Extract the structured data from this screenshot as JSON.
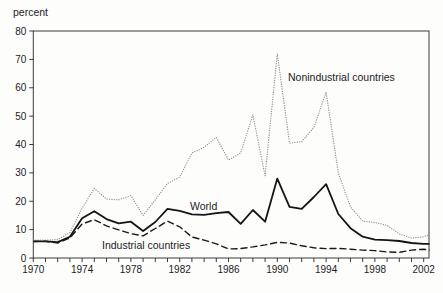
{
  "figure": {
    "y_axis_title": "percent",
    "annotations": [
      {
        "id": "nonindustrial",
        "text": "Nonindustrial countries",
        "x": 288,
        "y": 81
      },
      {
        "id": "world",
        "text": "World",
        "x": 190,
        "y": 210
      },
      {
        "id": "industrial",
        "text": "Industrial countries",
        "x": 102,
        "y": 249
      }
    ]
  },
  "chart_data": {
    "type": "line",
    "title": "",
    "xlabel": "",
    "ylabel": "percent",
    "ylim": [
      0,
      80
    ],
    "yticks": [
      0,
      10,
      20,
      30,
      40,
      50,
      60,
      70,
      80
    ],
    "xticks_labeled": [
      1970,
      1974,
      1978,
      1982,
      1986,
      1990,
      1994,
      1998,
      2002
    ],
    "xticks_minor_every_year": true,
    "grid": false,
    "legend_position": "inline-labels",
    "x": [
      1970,
      1971,
      1972,
      1973,
      1974,
      1975,
      1976,
      1977,
      1978,
      1979,
      1980,
      1981,
      1982,
      1983,
      1984,
      1985,
      1986,
      1987,
      1988,
      1989,
      1990,
      1991,
      1992,
      1993,
      1994,
      1995,
      1996,
      1997,
      1998,
      1999,
      2000,
      2001,
      2002,
      2003
    ],
    "series": [
      {
        "name": "Nonindustrial countries",
        "style": "dotted",
        "color": "#8f8f8f",
        "values": [
          6.3,
          6.3,
          6.5,
          9,
          17.5,
          24.5,
          20.8,
          20.5,
          22,
          15,
          20.5,
          26.3,
          28.5,
          37,
          39,
          42.5,
          34.5,
          37,
          50.5,
          29,
          72,
          40.5,
          41,
          46,
          58.5,
          30,
          18,
          13,
          12.5,
          11.5,
          8.5,
          7,
          7.5,
          9
        ]
      },
      {
        "name": "World",
        "style": "solid",
        "color": "#151515",
        "values": [
          5.9,
          5.9,
          5.6,
          7.5,
          14,
          16.5,
          13.7,
          12.2,
          12.8,
          9.5,
          12.7,
          17.3,
          16.6,
          15.4,
          15.2,
          15.8,
          16.2,
          12,
          16.9,
          12.8,
          28,
          18,
          17.3,
          21.5,
          26,
          15.5,
          10.5,
          7.5,
          6.5,
          6.3,
          6,
          5.3,
          5,
          5
        ]
      },
      {
        "name": "Industrial countries",
        "style": "dashed",
        "color": "#1a1a1a",
        "values": [
          5.8,
          5.9,
          5.3,
          7,
          12,
          13.5,
          11.3,
          9.9,
          8.6,
          7.8,
          10.4,
          13,
          11,
          7.4,
          6.3,
          5,
          3.2,
          3.3,
          3.9,
          4.6,
          5.5,
          5.3,
          4.3,
          3.6,
          3.3,
          3.4,
          3.1,
          2.8,
          2.6,
          2.1,
          2,
          2.8,
          3.1,
          2.4
        ]
      }
    ]
  }
}
